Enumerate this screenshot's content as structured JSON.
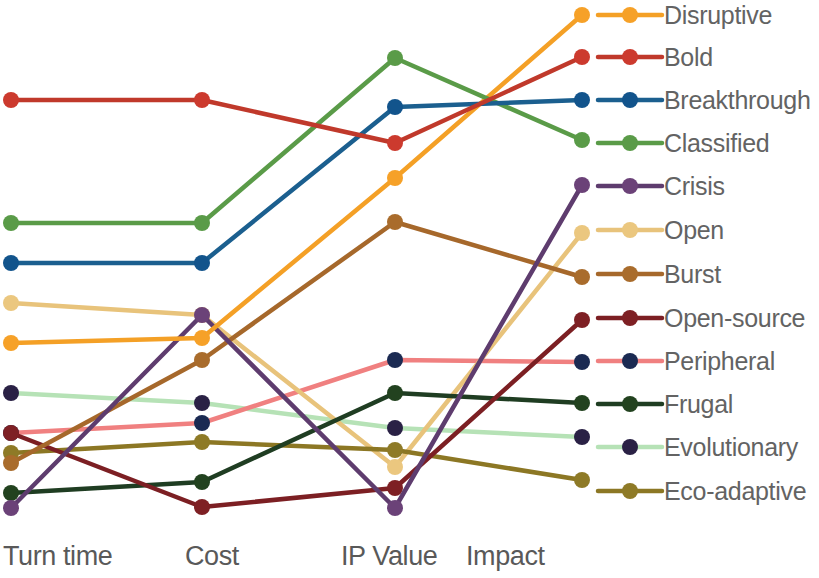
{
  "chart_data": {
    "type": "line",
    "title": "",
    "subtitle": "",
    "xlabel": "",
    "ylabel": "",
    "grid": false,
    "legend_position": "right",
    "categories": [
      "Turn time",
      "Cost",
      "IP Value",
      "Impact"
    ],
    "axis_x_positions": [
      11,
      202,
      395,
      582
    ],
    "ylim": [
      0,
      1
    ],
    "series": [
      {
        "name": "Disruptive",
        "color": "#F4A026",
        "marker_color": "#F6A128",
        "values": [
          0.262,
          0.372,
          0.705,
          0.979
        ],
        "pixel_y": [
          343,
          338,
          178,
          15
        ]
      },
      {
        "name": "Bold",
        "color": "#C0392B",
        "marker_color": "#CC3A2E",
        "values": [
          0.813,
          0.813,
          0.769,
          0.904
        ],
        "pixel_y": [
          100,
          100,
          143,
          57
        ]
      },
      {
        "name": "Breakthrough",
        "color": "#1B5F8F",
        "marker_color": "#12548C",
        "values": [
          0.501,
          0.501,
          0.794,
          0.813
        ],
        "pixel_y": [
          263,
          263,
          107,
          100
        ]
      },
      {
        "name": "Classified",
        "color": "#5A9B48",
        "marker_color": "#5A9B48",
        "values": [
          0.577,
          0.577,
          0.885,
          0.738
        ],
        "pixel_y": [
          223,
          223,
          58,
          140
        ]
      },
      {
        "name": "Crisis",
        "color": "#5E3C6E",
        "marker_color": "#6B4278",
        "values": [
          0.02,
          0.383,
          0.015,
          0.652
        ],
        "pixel_y": [
          508,
          315,
          508,
          185
        ]
      },
      {
        "name": "Open",
        "color": "#E8C37B",
        "marker_color": "#EBC77F",
        "values": [
          0.424,
          0.383,
          0.094,
          0.56
        ],
        "pixel_y": [
          303,
          315,
          467,
          233
        ]
      },
      {
        "name": "Burst",
        "color": "#A6682B",
        "marker_color": "#A96C2C",
        "values": [
          0.102,
          0.341,
          0.604,
          0.475
        ],
        "pixel_y": [
          463,
          360,
          222,
          277
        ]
      },
      {
        "name": "Open-source",
        "color": "#7C1F23",
        "marker_color": "#7E2024",
        "values": [
          0.243,
          0.045,
          0.055,
          0.392
        ],
        "pixel_y": [
          433,
          507,
          488,
          320
        ]
      },
      {
        "name": "Peripheral",
        "color": "#F08080",
        "marker_color": "#1B2A52",
        "values": [
          0.243,
          0.252,
          0.318,
          0.31
        ],
        "pixel_y": [
          433,
          423,
          360,
          362
        ]
      },
      {
        "name": "Frugal",
        "color": "#1F3D22",
        "marker_color": "#22421F",
        "values": [
          0.072,
          0.142,
          0.243,
          0.228
        ],
        "pixel_y": [
          493,
          482,
          393,
          403
        ]
      },
      {
        "name": "Evolutionary",
        "color": "#B6E2B6",
        "marker_color": "#2A2145",
        "values": [
          0.281,
          0.281,
          0.176,
          0.16
        ],
        "pixel_y": [
          393,
          403,
          428,
          437
        ]
      },
      {
        "name": "Eco-adaptive",
        "color": "#8C7724",
        "marker_color": "#8E7A27",
        "values": [
          0.143,
          0.207,
          0.133,
          0.075
        ],
        "pixel_y": [
          453,
          442,
          450,
          480
        ]
      }
    ]
  },
  "axes": {
    "items": [
      {
        "label": "Turn time",
        "left": 3
      },
      {
        "label": "Cost",
        "left": 185
      },
      {
        "label": "IP Value",
        "left": 341
      },
      {
        "label": "Impact",
        "left": 466
      }
    ]
  },
  "legend": {
    "items": [
      {
        "label": "Disruptive",
        "line_color": "#F4A026",
        "dot_color": "#F6A128",
        "y": 15
      },
      {
        "label": "Bold",
        "line_color": "#C0392B",
        "dot_color": "#CC3A2E",
        "y": 57
      },
      {
        "label": "Breakthrough",
        "line_color": "#1B5F8F",
        "dot_color": "#12548C",
        "y": 100
      },
      {
        "label": "Classified",
        "line_color": "#5A9B48",
        "dot_color": "#5A9B48",
        "y": 143
      },
      {
        "label": "Crisis",
        "line_color": "#5E3C6E",
        "dot_color": "#6B4278",
        "y": 186
      },
      {
        "label": "Open",
        "line_color": "#E8C37B",
        "dot_color": "#EBC77F",
        "y": 230
      },
      {
        "label": "Burst",
        "line_color": "#A6682B",
        "dot_color": "#A96C2C",
        "y": 274
      },
      {
        "label": "Open-source",
        "line_color": "#7C1F23",
        "dot_color": "#7E2024",
        "y": 318
      },
      {
        "label": "Peripheral",
        "line_color": "#F08080",
        "dot_color": "#1B2A52",
        "y": 361
      },
      {
        "label": "Frugal",
        "line_color": "#1F3D22",
        "dot_color": "#22421F",
        "y": 404
      },
      {
        "label": "Evolutionary",
        "line_color": "#B6E2B6",
        "dot_color": "#2A2145",
        "y": 447
      },
      {
        "label": "Eco-adaptive",
        "line_color": "#8C7724",
        "dot_color": "#8E7A27",
        "y": 491
      }
    ]
  }
}
